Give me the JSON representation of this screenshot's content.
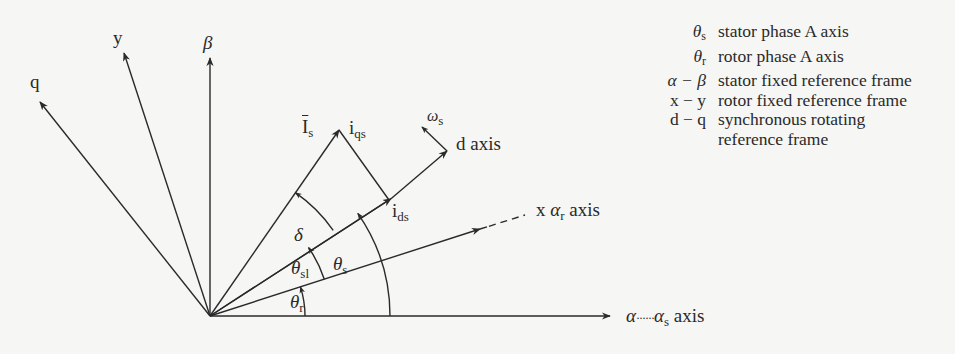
{
  "diagram": {
    "type": "vector-reference-frame-diagram",
    "origin": [
      210,
      316
    ],
    "axes": [
      {
        "id": "alpha",
        "label_main": "α",
        "label_dots": "······",
        "label_sub_main": "α",
        "label_sub": "s",
        "label_suffix": " axis",
        "angle_deg": 0
      },
      {
        "id": "x",
        "label_main": "x ",
        "label_greek": "α",
        "label_sub": "r",
        "label_suffix": " axis",
        "angle_deg": 17.8,
        "dashed_extension": true
      },
      {
        "id": "d",
        "label": "d axis",
        "angle_deg": 34.8
      },
      {
        "id": "beta",
        "label": "β",
        "angle_deg": 90
      },
      {
        "id": "y",
        "label": "y",
        "angle_deg": 108
      },
      {
        "id": "q",
        "label": "q",
        "angle_deg": 128.5
      }
    ],
    "vectors": {
      "Is": {
        "label": "I",
        "sub": "s",
        "overline": true,
        "angle_deg": 55.3
      },
      "iqs": {
        "label": "i",
        "sub": "qs"
      },
      "ids": {
        "label": "i",
        "sub": "ds"
      },
      "omega": {
        "label": "ω",
        "sub": "s"
      }
    },
    "angles": {
      "delta": {
        "label": "δ"
      },
      "theta_sl": {
        "label": "θ",
        "sub": "sl"
      },
      "theta_s": {
        "label": "θ",
        "sub": "s"
      },
      "theta_r": {
        "label": "θ",
        "sub": "r"
      }
    }
  },
  "legend": [
    {
      "sym": "θ",
      "sym_sub": "s",
      "desc": "stator phase A axis"
    },
    {
      "sym": "θ",
      "sym_sub": "r",
      "desc": "rotor phase A axis"
    },
    {
      "sym": "α − β",
      "sym_sub": "",
      "desc": "stator fixed reference frame"
    },
    {
      "sym": "x − y",
      "sym_sub": "",
      "desc": "rotor fixed reference frame"
    },
    {
      "sym": "d − q",
      "sym_sub": "",
      "desc": "synchronous rotating"
    },
    {
      "sym": "",
      "sym_sub": "",
      "desc": "reference frame"
    }
  ]
}
